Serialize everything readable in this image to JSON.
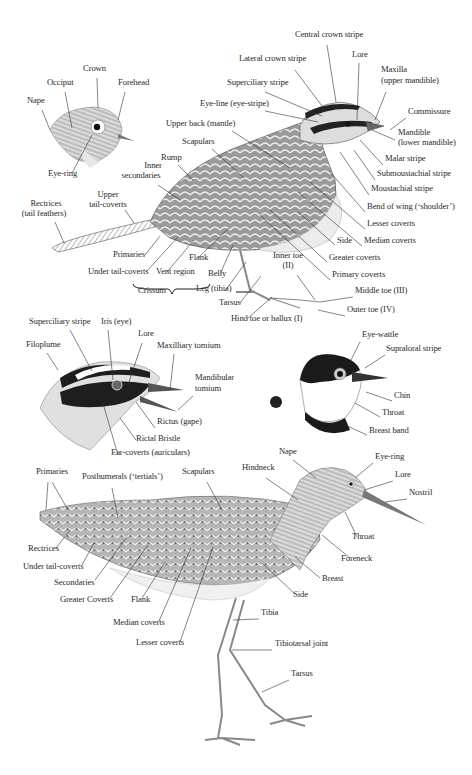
{
  "colors": {
    "ink": "#2a2a2a",
    "line": "#333333",
    "background": "#ffffff"
  },
  "figures": {
    "small_head": {
      "name": "Small bird head (crown/nape detail)",
      "labels": [
        {
          "id": "nape",
          "text": "Nape",
          "x": 27,
          "y": 103,
          "align": "l"
        },
        {
          "id": "occiput",
          "text": "Occiput",
          "x": 47,
          "y": 85,
          "align": "l"
        },
        {
          "id": "crown",
          "text": "Crown",
          "x": 83,
          "y": 71,
          "align": "l"
        },
        {
          "id": "forehead",
          "text": "Forehead",
          "x": 118,
          "y": 85,
          "align": "l"
        },
        {
          "id": "eye-ring",
          "text": "Eye-ring",
          "x": 48,
          "y": 176,
          "align": "l"
        }
      ]
    },
    "sparrow": {
      "name": "Passerine full body",
      "labels": [
        {
          "id": "central-crown-stripe",
          "text": "Central crown stripe",
          "x": 295,
          "y": 37,
          "align": "l"
        },
        {
          "id": "lateral-crown-stripe",
          "text": "Lateral crown stripe",
          "x": 239,
          "y": 61,
          "align": "l"
        },
        {
          "id": "lore",
          "text": "Lore",
          "x": 352,
          "y": 57,
          "align": "l"
        },
        {
          "id": "maxilla",
          "text": "Maxilla",
          "x": 381,
          "y": 72,
          "align": "l"
        },
        {
          "id": "maxilla-sub",
          "text": "(upper mandible)",
          "x": 381,
          "y": 83,
          "align": "l"
        },
        {
          "id": "superciliary-stripe",
          "text": "Superciliary stripe",
          "x": 227,
          "y": 85,
          "align": "l"
        },
        {
          "id": "eye-line",
          "text": "Eye-line (eye-stripe)",
          "x": 200,
          "y": 106,
          "align": "l"
        },
        {
          "id": "commissure",
          "text": "Commissure",
          "x": 408,
          "y": 114,
          "align": "l"
        },
        {
          "id": "upper-back",
          "text": "Upper back (mantle)",
          "x": 166,
          "y": 126,
          "align": "l"
        },
        {
          "id": "mandible",
          "text": "Mandible",
          "x": 398,
          "y": 135,
          "align": "l"
        },
        {
          "id": "mandible-sub",
          "text": "(lower mandible)",
          "x": 398,
          "y": 145,
          "align": "l"
        },
        {
          "id": "scapulars",
          "text": "Scapulars",
          "x": 182,
          "y": 144,
          "align": "l"
        },
        {
          "id": "rump",
          "text": "Rump",
          "x": 161,
          "y": 160,
          "align": "l"
        },
        {
          "id": "malar-stripe",
          "text": "Malar stripe",
          "x": 385,
          "y": 161,
          "align": "l"
        },
        {
          "id": "inner-secondaries",
          "text": "Inner",
          "x": 153,
          "y": 168,
          "align": "c"
        },
        {
          "id": "inner-secondaries-2",
          "text": "secondaries",
          "x": 141,
          "y": 178,
          "align": "c"
        },
        {
          "id": "submoustachial-stripe",
          "text": "Submoustachial stripe",
          "x": 377,
          "y": 176,
          "align": "l"
        },
        {
          "id": "moustachial-stripe",
          "text": "Moustachial stripe",
          "x": 371,
          "y": 191,
          "align": "l"
        },
        {
          "id": "upper-tail-coverts",
          "text": "Upper",
          "x": 108,
          "y": 197,
          "align": "c"
        },
        {
          "id": "upper-tail-coverts-2",
          "text": "tail-coverts",
          "x": 108,
          "y": 207,
          "align": "c"
        },
        {
          "id": "rectrices",
          "text": "Rectrices",
          "x": 46,
          "y": 206,
          "align": "c"
        },
        {
          "id": "rectrices-2",
          "text": "(tail feathers)",
          "x": 44,
          "y": 216,
          "align": "c"
        },
        {
          "id": "bend-of-wing",
          "text": "Bend of wing (‘shoulder’)",
          "x": 367,
          "y": 209,
          "align": "l"
        },
        {
          "id": "lesser-coverts",
          "text": "Lesser coverts",
          "x": 367,
          "y": 226,
          "align": "l"
        },
        {
          "id": "side",
          "text": "Side",
          "x": 337,
          "y": 243,
          "align": "l"
        },
        {
          "id": "median-coverts",
          "text": "Median coverts",
          "x": 364,
          "y": 243,
          "align": "l"
        },
        {
          "id": "inner-toe",
          "text": "Inner toe",
          "x": 288,
          "y": 258,
          "align": "c"
        },
        {
          "id": "inner-toe-2",
          "text": "(II)",
          "x": 288,
          "y": 268,
          "align": "c"
        },
        {
          "id": "greater-coverts",
          "text": "Greater coverts",
          "x": 329,
          "y": 260,
          "align": "l"
        },
        {
          "id": "primaries",
          "text": "Primaries",
          "x": 113,
          "y": 257,
          "align": "l"
        },
        {
          "id": "flank",
          "text": "Flank",
          "x": 189,
          "y": 260,
          "align": "l"
        },
        {
          "id": "belly",
          "text": "Belly",
          "x": 208,
          "y": 276,
          "align": "l"
        },
        {
          "id": "primary-coverts",
          "text": "Primary coverts",
          "x": 332,
          "y": 277,
          "align": "l"
        },
        {
          "id": "under-tail-coverts",
          "text": "Under tail-coverts",
          "x": 88,
          "y": 274,
          "align": "l"
        },
        {
          "id": "vent-region",
          "text": "Vent region",
          "x": 156,
          "y": 274,
          "align": "l"
        },
        {
          "id": "middle-toe",
          "text": "Middle toe (III)",
          "x": 355,
          "y": 293,
          "align": "l"
        },
        {
          "id": "leg-tibia",
          "text": "Leg (tibia)",
          "x": 196,
          "y": 291,
          "align": "l"
        },
        {
          "id": "crissum",
          "text": "Crissum",
          "x": 138,
          "y": 293,
          "align": "l"
        },
        {
          "id": "tarsus",
          "text": "Tarsus",
          "x": 219,
          "y": 305,
          "align": "l"
        },
        {
          "id": "outer-toe",
          "text": "Outer toe (IV)",
          "x": 347,
          "y": 312,
          "align": "l"
        },
        {
          "id": "hind-toe",
          "text": "Hind toe or hallux (I)",
          "x": 231,
          "y": 321,
          "align": "l"
        }
      ]
    },
    "open_bill_head": {
      "name": "Head with open bill",
      "labels": [
        {
          "id": "superciliary-stripe",
          "text": "Superciliary stripe",
          "x": 29,
          "y": 324,
          "align": "l"
        },
        {
          "id": "iris",
          "text": "Iris (eye)",
          "x": 101,
          "y": 324,
          "align": "l"
        },
        {
          "id": "lore",
          "text": "Lore",
          "x": 138,
          "y": 336,
          "align": "l"
        },
        {
          "id": "filoplume",
          "text": "Filoplume",
          "x": 26,
          "y": 347,
          "align": "l"
        },
        {
          "id": "maxilliary-tomium",
          "text": "Maxilliary tomium",
          "x": 157,
          "y": 348,
          "align": "l"
        },
        {
          "id": "mandibular-tomium",
          "text": "Mandibular",
          "x": 195,
          "y": 380,
          "align": "l"
        },
        {
          "id": "mandibular-tomium-2",
          "text": "tomium",
          "x": 195,
          "y": 391,
          "align": "l"
        },
        {
          "id": "rictus",
          "text": "Rictus (gape)",
          "x": 157,
          "y": 424,
          "align": "l"
        },
        {
          "id": "rictal-bristle",
          "text": "Rictal Bristle",
          "x": 136,
          "y": 441,
          "align": "l"
        },
        {
          "id": "ear-coverts",
          "text": "Ear-coverts (auriculars)",
          "x": 111,
          "y": 455,
          "align": "l"
        }
      ]
    },
    "crested_head": {
      "name": "Head with eye-wattle",
      "labels": [
        {
          "id": "eye-wattle",
          "text": "Eye-wattle",
          "x": 362,
          "y": 337,
          "align": "l"
        },
        {
          "id": "supraloral-stripe",
          "text": "Supraloral stripe",
          "x": 386,
          "y": 351,
          "align": "l"
        },
        {
          "id": "chin",
          "text": "Chin",
          "x": 394,
          "y": 398,
          "align": "l"
        },
        {
          "id": "throat",
          "text": "Throat",
          "x": 382,
          "y": 415,
          "align": "l"
        },
        {
          "id": "breast-band",
          "text": "Breast band",
          "x": 369,
          "y": 433,
          "align": "l"
        }
      ]
    },
    "wader": {
      "name": "Wader full body",
      "labels": [
        {
          "id": "nape",
          "text": "Nape",
          "x": 279,
          "y": 454,
          "align": "l"
        },
        {
          "id": "eye-ring",
          "text": "Eye-ring",
          "x": 375,
          "y": 459,
          "align": "l"
        },
        {
          "id": "primaries",
          "text": "Primaries",
          "x": 36,
          "y": 474,
          "align": "l"
        },
        {
          "id": "posthumerals",
          "text": "Posthumerals (‘tertials’)",
          "x": 82,
          "y": 479,
          "align": "l"
        },
        {
          "id": "scapulars",
          "text": "Scapulars",
          "x": 182,
          "y": 474,
          "align": "l"
        },
        {
          "id": "hindneck",
          "text": "Hindneck",
          "x": 242,
          "y": 470,
          "align": "l"
        },
        {
          "id": "lore",
          "text": "Lore",
          "x": 395,
          "y": 477,
          "align": "l"
        },
        {
          "id": "nostril",
          "text": "Nostril",
          "x": 409,
          "y": 495,
          "align": "l"
        },
        {
          "id": "throat",
          "text": "Throat",
          "x": 352,
          "y": 539,
          "align": "l"
        },
        {
          "id": "rectrices",
          "text": "Rectrices",
          "x": 28,
          "y": 551,
          "align": "l"
        },
        {
          "id": "foreneck",
          "text": "Foreneck",
          "x": 341,
          "y": 561,
          "align": "l"
        },
        {
          "id": "under-tail-coverts",
          "text": "Under tail-coverts",
          "x": 23,
          "y": 569,
          "align": "l"
        },
        {
          "id": "breast",
          "text": "Breast",
          "x": 322,
          "y": 581,
          "align": "l"
        },
        {
          "id": "secondaries",
          "text": "Secondaries",
          "x": 54,
          "y": 585,
          "align": "l"
        },
        {
          "id": "side",
          "text": "Side",
          "x": 293,
          "y": 597,
          "align": "l"
        },
        {
          "id": "greater-coverts",
          "text": "Greater Coverts",
          "x": 60,
          "y": 602,
          "align": "l"
        },
        {
          "id": "flank",
          "text": "Flank",
          "x": 131,
          "y": 602,
          "align": "l"
        },
        {
          "id": "tibia",
          "text": "Tibia",
          "x": 261,
          "y": 615,
          "align": "l"
        },
        {
          "id": "median-coverts",
          "text": "Median coverts",
          "x": 113,
          "y": 625,
          "align": "l"
        },
        {
          "id": "tibiotarsal-joint",
          "text": "Tibiotarsal joint",
          "x": 275,
          "y": 646,
          "align": "l"
        },
        {
          "id": "lesser-coverts",
          "text": "Lesser coverts",
          "x": 136,
          "y": 645,
          "align": "l"
        },
        {
          "id": "tarsus",
          "text": "Tarsus",
          "x": 291,
          "y": 676,
          "align": "l"
        }
      ]
    }
  }
}
